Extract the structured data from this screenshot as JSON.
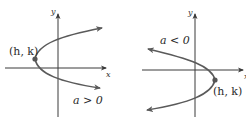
{
  "colors": {
    "axis": "#3a3a3a",
    "curve": "#5a5a5a",
    "vertex_dot": "#555555",
    "text": "#2a2a2a",
    "background": "#ffffff"
  },
  "panels": [
    {
      "id": "left",
      "axis_x_label": "x",
      "axis_y_label": "y",
      "vertex_label": "(h, k)",
      "condition_label": "a > 0",
      "opens": "right"
    },
    {
      "id": "right",
      "axis_x_label": "x",
      "axis_y_label": "y",
      "vertex_label": "(h, k)",
      "condition_label": "a < 0",
      "opens": "left"
    }
  ]
}
